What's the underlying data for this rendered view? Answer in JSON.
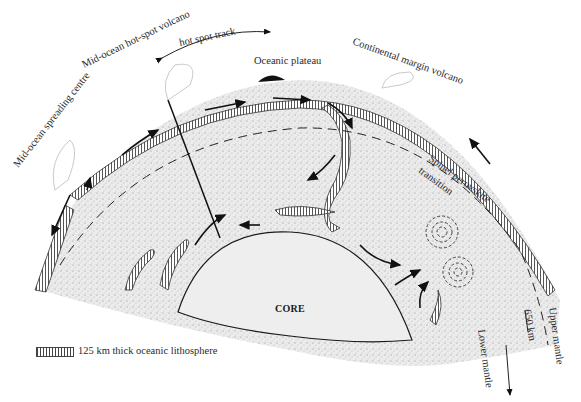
{
  "diagram": {
    "type": "mantle-convection-cross-section",
    "labels": {
      "mid_ocean_spreading_centre": "Mid-ocean spreading centre",
      "mid_ocean_hot_spot_volcano": "Mid-ocean hot-spot volcano",
      "hot_spot_track": "hot spot track",
      "oceanic_plateau": "Oceanic plateau",
      "continental_margin_volcano": "Continental margin volcano",
      "spinel_perovskite": "Spinel perovskite",
      "transition": "transition",
      "core": "CORE",
      "depth_650": "650 km",
      "upper_mantle": "Upper mantle",
      "lower_mantle": "Lower mantle"
    },
    "legend": {
      "swatch": "hatched-lithosphere-pattern",
      "text": "125 km thick oceanic lithosphere"
    },
    "colors": {
      "mantle_fill": "#e6e6e6",
      "core_fill": "#eeeeee",
      "ink": "#1a1a1a",
      "background": "#ffffff"
    }
  }
}
